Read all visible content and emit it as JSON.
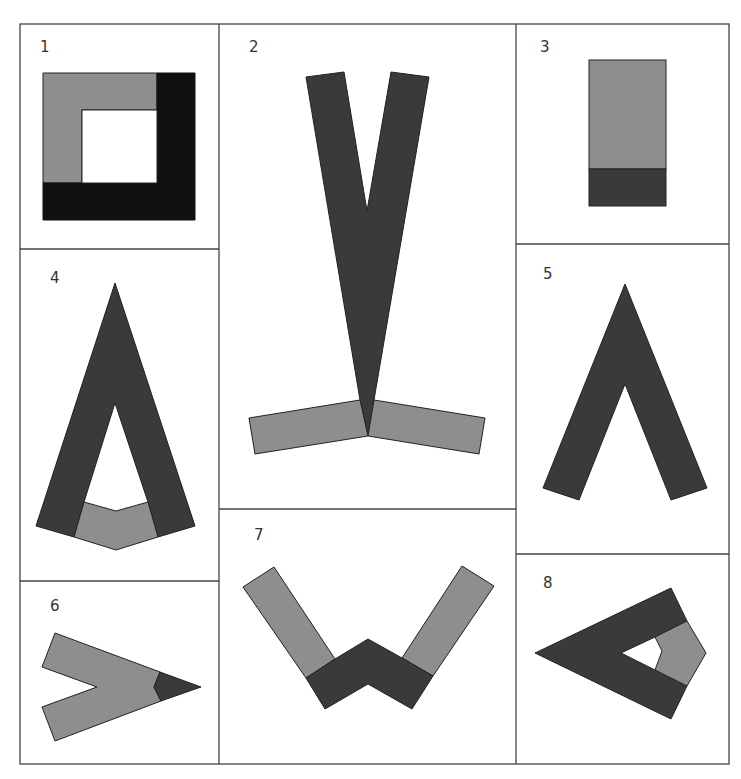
{
  "figure": {
    "colors": {
      "gray": "#8e8e8e",
      "dark": "#3a3a3a",
      "black": "#111111",
      "border": "#444444",
      "background": "#ffffff"
    },
    "panels": [
      {
        "id": 1,
        "label": "1",
        "shape": "square ring: gray top/left L, black right/bottom L, white hole"
      },
      {
        "id": 2,
        "label": "2",
        "shape": "tall dark V standing on two gray sloped bars"
      },
      {
        "id": 3,
        "label": "3",
        "shape": "vertical rectangle, gray top, dark bottom band"
      },
      {
        "id": 4,
        "label": "4",
        "shape": "dark A-frame with gray chevron base"
      },
      {
        "id": 5,
        "label": "5",
        "shape": "dark inverted V (caret)"
      },
      {
        "id": 6,
        "label": "6",
        "shape": "gray arrow pointing right with dark tip"
      },
      {
        "id": 7,
        "label": "7",
        "shape": "gray bars joined by dark W-shaped base"
      },
      {
        "id": 8,
        "label": "8",
        "shape": "dark left-pointing triangle frame with gray pentagon end"
      }
    ]
  }
}
